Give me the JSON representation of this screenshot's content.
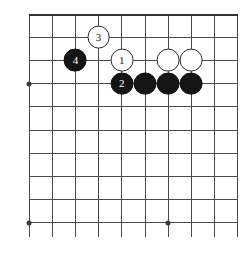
{
  "figure": {
    "type": "go-board-diagram",
    "title": "",
    "board": {
      "columns": 10,
      "rows": 10,
      "origin_x": 29,
      "origin_y": 14,
      "spacing": 23.2,
      "line_color": "#4a4a4a",
      "background_color": "#ffffff",
      "top_edge_is_board_boundary": true
    },
    "star_points": [
      {
        "name": "star-point-left",
        "col": 0,
        "row": 3
      },
      {
        "name": "star-point-bottom-left",
        "col": 0,
        "row": 9
      },
      {
        "name": "star-point-bottom-center",
        "col": 6,
        "row": 9
      }
    ],
    "stones": [
      {
        "name": "white-stone-move-3",
        "color": "white",
        "label": "3",
        "col": 3,
        "row": 1
      },
      {
        "name": "black-stone-move-4",
        "color": "black",
        "label": "4",
        "col": 2,
        "row": 2
      },
      {
        "name": "white-stone-move-1",
        "color": "white",
        "label": "1",
        "col": 4,
        "row": 2
      },
      {
        "name": "white-stone-right-a",
        "color": "white",
        "label": "",
        "col": 6,
        "row": 2
      },
      {
        "name": "white-stone-right-b",
        "color": "white",
        "label": "",
        "col": 7,
        "row": 2
      },
      {
        "name": "black-stone-move-2",
        "color": "black",
        "label": "2",
        "col": 4,
        "row": 3
      },
      {
        "name": "black-stone-chain-a",
        "color": "black",
        "label": "",
        "col": 5,
        "row": 3
      },
      {
        "name": "black-stone-chain-b",
        "color": "black",
        "label": "",
        "col": 6,
        "row": 3
      },
      {
        "name": "black-stone-chain-c",
        "color": "black",
        "label": "",
        "col": 7,
        "row": 3
      }
    ],
    "stone_radius": 11.4,
    "colors": {
      "black_stone": "#151515",
      "white_stone": "#ffffff",
      "stone_outline": "#2b2b2b",
      "grid": "#4a4a4a",
      "black_label_text": "#ffffff",
      "white_label_text": "#1a1a1a"
    }
  }
}
